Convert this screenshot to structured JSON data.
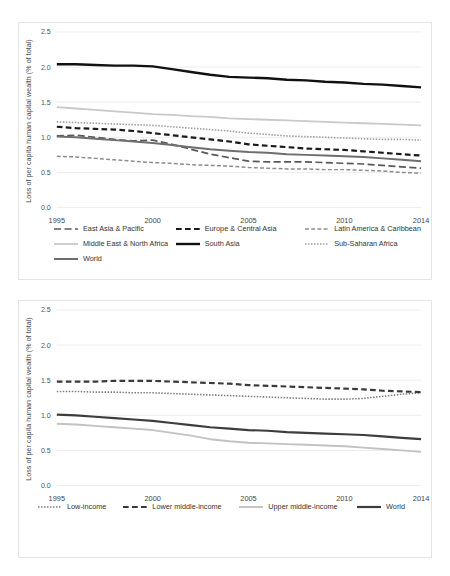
{
  "figure": {
    "ylabel": "Loss of per capita human capital wealth (% of total)",
    "xticks": [
      "1995",
      "2000",
      "2005",
      "2010",
      "2014"
    ],
    "yticks": [
      "0.0",
      "0.5",
      "1.0",
      "1.5",
      "2.0",
      "2.5"
    ]
  },
  "chart_data": [
    {
      "type": "line",
      "title": "",
      "xlabel": "",
      "ylabel": "Loss of per capita human capital wealth (% of total)",
      "x": [
        1995,
        1996,
        1997,
        1998,
        1999,
        2000,
        2001,
        2002,
        2003,
        2004,
        2005,
        2006,
        2007,
        2008,
        2009,
        2010,
        2011,
        2012,
        2013,
        2014
      ],
      "xlim": [
        1995,
        2014
      ],
      "ylim": [
        0.0,
        2.5
      ],
      "yticks": [
        0.0,
        0.5,
        1.0,
        1.5,
        2.0,
        2.5
      ],
      "xticks": [
        1995,
        2000,
        2005,
        2010,
        2014
      ],
      "grid": "horizontal",
      "legend": "bottom",
      "series": [
        {
          "name": "East Asia & Pacific",
          "style": "long-dash",
          "color": "#595959",
          "width": 1.7,
          "values": [
            1.02,
            1.03,
            1.0,
            0.97,
            0.95,
            0.96,
            0.9,
            0.83,
            0.76,
            0.71,
            0.66,
            0.65,
            0.65,
            0.65,
            0.64,
            0.63,
            0.62,
            0.6,
            0.58,
            0.56
          ]
        },
        {
          "name": "Europe & Central Asia",
          "style": "dash",
          "color": "#1a1a1a",
          "width": 2.2,
          "values": [
            1.15,
            1.13,
            1.12,
            1.11,
            1.09,
            1.06,
            1.03,
            1.0,
            0.97,
            0.94,
            0.9,
            0.88,
            0.86,
            0.84,
            0.83,
            0.82,
            0.8,
            0.78,
            0.76,
            0.74
          ]
        },
        {
          "name": "Latin America & Caribbean",
          "style": "dash",
          "color": "#8c8c8c",
          "width": 1.5,
          "values": [
            0.73,
            0.72,
            0.7,
            0.68,
            0.66,
            0.64,
            0.63,
            0.61,
            0.6,
            0.59,
            0.57,
            0.56,
            0.55,
            0.55,
            0.54,
            0.54,
            0.53,
            0.52,
            0.5,
            0.49
          ]
        },
        {
          "name": "Middle East & North Africa",
          "style": "solid",
          "color": "#c9c9c9",
          "width": 1.8,
          "values": [
            1.43,
            1.41,
            1.39,
            1.37,
            1.35,
            1.33,
            1.32,
            1.3,
            1.29,
            1.27,
            1.26,
            1.25,
            1.24,
            1.23,
            1.22,
            1.21,
            1.2,
            1.19,
            1.18,
            1.17
          ]
        },
        {
          "name": "South Asia",
          "style": "solid",
          "color": "#111111",
          "width": 2.4,
          "values": [
            2.04,
            2.04,
            2.03,
            2.02,
            2.02,
            2.01,
            1.97,
            1.93,
            1.89,
            1.86,
            1.85,
            1.84,
            1.82,
            1.81,
            1.79,
            1.78,
            1.76,
            1.75,
            1.73,
            1.71
          ]
        },
        {
          "name": "Sub-Saharan Africa",
          "style": "dot",
          "color": "#9d9d9d",
          "width": 1.6,
          "values": [
            1.22,
            1.21,
            1.2,
            1.19,
            1.18,
            1.17,
            1.15,
            1.13,
            1.11,
            1.09,
            1.06,
            1.04,
            1.02,
            1.01,
            1.0,
            0.99,
            0.98,
            0.97,
            0.97,
            0.96
          ]
        },
        {
          "name": "World",
          "style": "solid",
          "color": "#6e6e6e",
          "width": 2.0,
          "values": [
            1.01,
            1.0,
            0.98,
            0.96,
            0.94,
            0.92,
            0.89,
            0.86,
            0.83,
            0.81,
            0.79,
            0.78,
            0.76,
            0.75,
            0.74,
            0.73,
            0.72,
            0.7,
            0.68,
            0.66
          ]
        }
      ]
    },
    {
      "type": "line",
      "title": "",
      "xlabel": "",
      "ylabel": "Loss of per capita human capital wealth (% of total)",
      "x": [
        1995,
        1996,
        1997,
        1998,
        1999,
        2000,
        2001,
        2002,
        2003,
        2004,
        2005,
        2006,
        2007,
        2008,
        2009,
        2010,
        2011,
        2012,
        2013,
        2014
      ],
      "xlim": [
        1995,
        2014
      ],
      "ylim": [
        0.0,
        2.5
      ],
      "yticks": [
        0.0,
        0.5,
        1.0,
        1.5,
        2.0,
        2.5
      ],
      "xticks": [
        1995,
        2000,
        2005,
        2010,
        2014
      ],
      "grid": "horizontal",
      "legend": "bottom",
      "series": [
        {
          "name": "Low-income",
          "style": "dot",
          "color": "#7d7d7d",
          "width": 1.6,
          "values": [
            1.34,
            1.34,
            1.33,
            1.33,
            1.32,
            1.32,
            1.31,
            1.3,
            1.29,
            1.28,
            1.27,
            1.26,
            1.25,
            1.24,
            1.23,
            1.23,
            1.24,
            1.27,
            1.3,
            1.32
          ]
        },
        {
          "name": "Lower middle-income",
          "style": "dash",
          "color": "#3a3a3a",
          "width": 2.2,
          "values": [
            1.48,
            1.48,
            1.48,
            1.49,
            1.49,
            1.49,
            1.48,
            1.47,
            1.46,
            1.45,
            1.43,
            1.42,
            1.41,
            1.4,
            1.39,
            1.38,
            1.37,
            1.35,
            1.34,
            1.33
          ]
        },
        {
          "name": "Upper middle-income",
          "style": "solid",
          "color": "#c2c2c2",
          "width": 1.9,
          "values": [
            0.88,
            0.87,
            0.85,
            0.83,
            0.81,
            0.79,
            0.75,
            0.71,
            0.66,
            0.63,
            0.61,
            0.6,
            0.59,
            0.58,
            0.57,
            0.56,
            0.54,
            0.52,
            0.5,
            0.48
          ]
        },
        {
          "name": "World",
          "style": "solid",
          "color": "#3d3d3d",
          "width": 2.2,
          "values": [
            1.01,
            1.0,
            0.98,
            0.96,
            0.94,
            0.92,
            0.89,
            0.86,
            0.83,
            0.81,
            0.79,
            0.78,
            0.76,
            0.75,
            0.74,
            0.73,
            0.72,
            0.7,
            0.68,
            0.66
          ]
        }
      ]
    }
  ],
  "legends": {
    "top": [
      [
        "East Asia & Pacific",
        "Europe & Central Asia",
        "Latin America & Caribbean"
      ],
      [
        "Middle East & North Africa",
        "South Asia",
        "Sub-Saharan Africa"
      ],
      [
        "World"
      ]
    ],
    "bottom": [
      [
        "Low-income",
        "Lower middle-income",
        "Upper middle-income",
        "World"
      ]
    ]
  }
}
